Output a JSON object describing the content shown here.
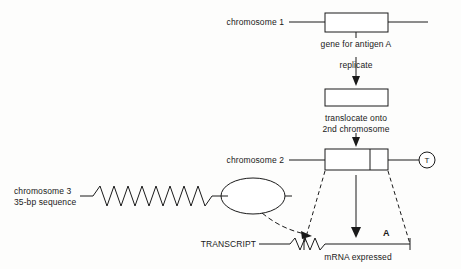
{
  "labels": {
    "chromosome1": "chromosome 1",
    "gene_for_antigen_a": "gene for antigen A",
    "replicate": "replicate",
    "translocate_line1": "translocate onto",
    "translocate_line2": "2nd chromosome",
    "chromosome2": "chromosome 2",
    "chromosome3_line1": "chromosome 3",
    "chromosome3_line2": "35-bp sequence",
    "transcript": "TRANSCRIPT",
    "mrna_expressed": "mRNA expressed",
    "antigen_a_marker": "A",
    "telomere_marker": "T"
  },
  "icons": {
    "gene_box": "rectangle-gene-box",
    "arrow_down": "down-arrow-icon",
    "dashed_arrow": "curved-dashed-arrow-icon",
    "zigzag": "zigzag-sequence-icon",
    "ellipse": "ellipse-loop-icon",
    "circle_t": "circle-t-telomere-icon"
  },
  "colors": {
    "stroke": "#1a1a1a",
    "background": "#fdfdfc"
  }
}
